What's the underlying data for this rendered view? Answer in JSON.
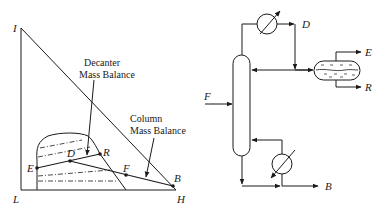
{
  "ternary_diagram": {
    "vertex_labels": {
      "top": "I",
      "bottom_left": "L",
      "bottom_right": "H"
    },
    "points": {
      "E": "E",
      "D": "D",
      "R": "R",
      "F": "F",
      "B": "B"
    },
    "annotations": {
      "decanter_line1": "Decanter",
      "decanter_line2": "Mass Balance",
      "column_line1": "Column",
      "column_line2": "Mass Balance"
    }
  },
  "process_flowsheet": {
    "streams": {
      "feed": "F",
      "distillate": "D",
      "extract": "E",
      "raffinate": "R",
      "bottoms": "B"
    },
    "units": [
      "distillation-column",
      "condenser",
      "decanter",
      "reboiler"
    ]
  },
  "colors": {
    "line": "#1a1a1a",
    "background": "#ffffff"
  }
}
